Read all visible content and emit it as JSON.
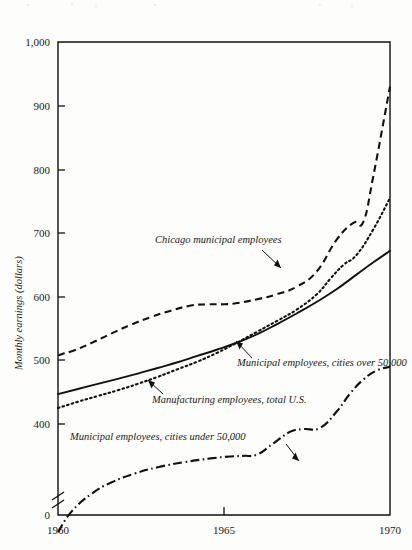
{
  "chart_data": {
    "type": "line",
    "title": "",
    "xlabel": "",
    "ylabel": "Monthly earnings (dollars)",
    "xlim": [
      1960,
      1970
    ],
    "ylim": [
      0,
      1000
    ],
    "y_axis_break": true,
    "y_axis_break_note": "axis broken between 0 and about 350",
    "grid": false,
    "legend": "inline annotations with leader arrows",
    "xticks": [
      "1960",
      "1965",
      "1970"
    ],
    "xtick_values": [
      1960,
      1965,
      1970
    ],
    "yticks": [
      "0",
      "400",
      "500",
      "600",
      "700",
      "800",
      "900",
      "1,000"
    ],
    "ytick_values": [
      0,
      400,
      500,
      600,
      700,
      800,
      900,
      1000
    ],
    "series": [
      {
        "name": "Chicago municipal employees",
        "style": "dashed",
        "x": [
          1960,
          1960.5,
          1961,
          1961.6,
          1962.2,
          1962.8,
          1963.4,
          1964,
          1964.5,
          1965,
          1965.4,
          1966,
          1966.6,
          1967.2,
          1967.8,
          1968.4,
          1968.9,
          1969.2,
          1969.5,
          1970
        ],
        "values": [
          508,
          516,
          527,
          542,
          556,
          568,
          578,
          586,
          588,
          588,
          590,
          596,
          604,
          616,
          640,
          690,
          716,
          718,
          790,
          930
        ]
      },
      {
        "name": "Municipal employees, cities over 50,000",
        "style": "dotted",
        "x": [
          1960,
          1960.6,
          1961.2,
          1961.8,
          1962.4,
          1963,
          1963.6,
          1964.2,
          1964.8,
          1965.4,
          1966,
          1966.6,
          1967.2,
          1967.8,
          1968.2,
          1968.6,
          1969,
          1969.5,
          1970
        ],
        "values": [
          425,
          435,
          444,
          453,
          463,
          474,
          486,
          498,
          512,
          528,
          545,
          562,
          580,
          604,
          628,
          650,
          666,
          706,
          755
        ]
      },
      {
        "name": "Manufacturing employees, total U.S.",
        "style": "solid",
        "x": [
          1960,
          1960.6,
          1961.2,
          1961.8,
          1962.4,
          1963,
          1963.6,
          1964.2,
          1964.8,
          1965.4,
          1966,
          1966.6,
          1967.2,
          1967.8,
          1968.4,
          1969,
          1969.5,
          1970
        ],
        "values": [
          447,
          455,
          463,
          471,
          479,
          488,
          497,
          507,
          517,
          528,
          541,
          557,
          574,
          592,
          612,
          635,
          654,
          672
        ]
      },
      {
        "name": "Municipal employees, cities under 50,000",
        "style": "dash-dot",
        "x": [
          1960,
          1960.4,
          1961,
          1961.6,
          1962.3,
          1963,
          1963.8,
          1964.6,
          1965.2,
          1965.6,
          1966,
          1966.5,
          1967,
          1967.4,
          1967.9,
          1968.4,
          1968.8,
          1969.2,
          1969.6,
          1970
        ],
        "values": [
          230,
          262,
          290,
          308,
          322,
          332,
          340,
          346,
          349,
          350,
          352,
          370,
          388,
          392,
          394,
          420,
          448,
          470,
          484,
          490
        ]
      }
    ],
    "annotations": [
      {
        "text": "Chicago municipal employees",
        "target_series": "Chicago municipal employees"
      },
      {
        "text": "Manufacturing employees, total U.S.",
        "target_series": "Manufacturing employees, total U.S."
      },
      {
        "text": "Municipal employees, cities over 50,000",
        "target_series": "Municipal employees, cities over 50,000"
      },
      {
        "text": "Municipal employees, cities under 50,000",
        "target_series": "Municipal employees, cities under 50,000"
      }
    ]
  },
  "colors": {
    "ink": "#111111",
    "paper": "#fdfdfc"
  }
}
